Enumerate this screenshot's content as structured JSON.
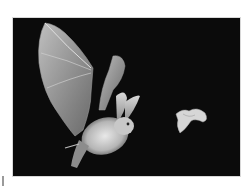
{
  "image": {
    "subject": "bat in flight chasing a moth",
    "background_color": "#0b0b0b",
    "page_background": "#ffffff",
    "elements": [
      {
        "name": "bat",
        "description": "long-eared bat with outstretched wings"
      },
      {
        "name": "moth",
        "description": "small pale moth in flight"
      }
    ]
  }
}
